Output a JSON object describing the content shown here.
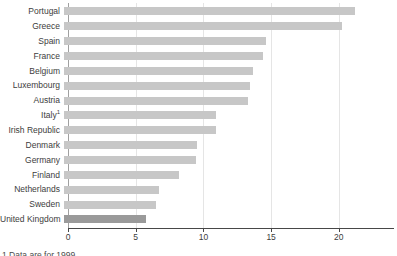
{
  "chart_data": {
    "type": "bar",
    "orientation": "horizontal",
    "title": "",
    "xlabel": "",
    "ylabel": "",
    "categories": [
      "Portugal",
      "Greece",
      "Spain",
      "France",
      "Belgium",
      "Luxembourg",
      "Austria",
      "Italy",
      "Irish Republic",
      "Denmark",
      "Germany",
      "Finland",
      "Netherlands",
      "Sweden",
      "United Kingdom"
    ],
    "category_superscripts": [
      "",
      "",
      "",
      "",
      "",
      "",
      "",
      "1",
      "",
      "",
      "",
      "",
      "",
      "",
      ""
    ],
    "values": [
      21.2,
      20.3,
      14.7,
      14.5,
      13.8,
      13.6,
      13.4,
      11.1,
      11.1,
      9.7,
      9.6,
      8.4,
      6.9,
      6.7,
      6.0
    ],
    "x_ticks": [
      0,
      5,
      10,
      15,
      20
    ],
    "xlim": [
      0,
      24
    ],
    "grid": "vertical-light",
    "legend": "none",
    "highlight_index": 14,
    "bar_color": "#c7c7c7",
    "highlight_color": "#9a9a9a",
    "axis_color": "#474747",
    "zero_line_color": "#a0a0a0",
    "gridline_color": "#e5e5e5"
  },
  "footnote": "1 Data are for 1999"
}
